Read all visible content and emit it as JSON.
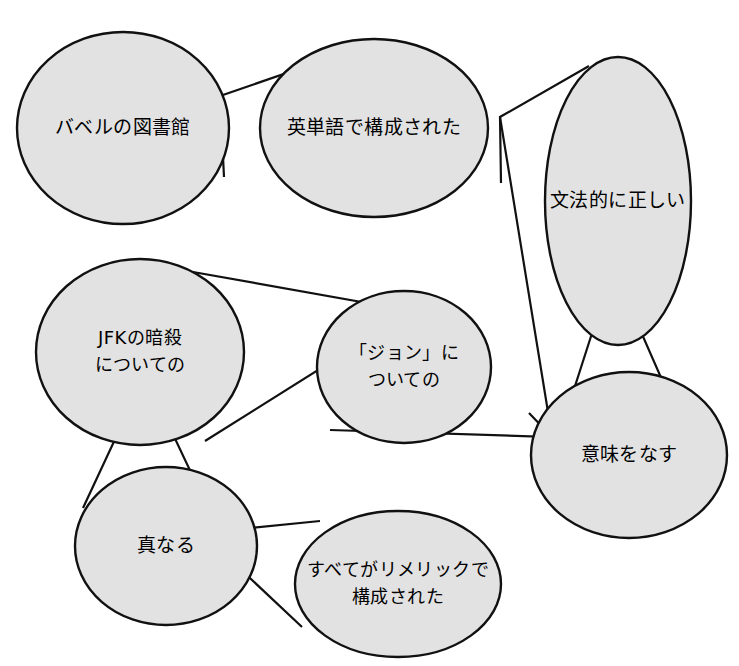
{
  "diagram": {
    "type": "concept-ellipse-graph",
    "title": "",
    "background_color": "#ffffff",
    "ellipse_fill": "#e2e2e2",
    "ellipse_stroke": "#111111",
    "line_stroke": "#111111",
    "nodes": [
      {
        "id": "library-of-babel",
        "label": "バベルの図書館",
        "lines": [
          "バベルの図書館"
        ],
        "cx": 123,
        "cy": 128,
        "rx": 106,
        "ry": 96
      },
      {
        "id": "composed-of-english-words",
        "label": "英単語で構成された",
        "lines": [
          "英単語で構成された"
        ],
        "cx": 374,
        "cy": 128,
        "rx": 114,
        "ry": 89
      },
      {
        "id": "grammatically-correct",
        "label": "文法的に正しい",
        "lines": [
          "文法的に正しい"
        ],
        "cx": 618,
        "cy": 201,
        "rx": 73,
        "ry": 144
      },
      {
        "id": "about-jfk-assassination",
        "label": "JFKの暗殺についての",
        "lines": [
          "JFKの暗殺",
          "についての"
        ],
        "cx": 140,
        "cy": 352,
        "rx": 104,
        "ry": 93
      },
      {
        "id": "about-john",
        "label": "「ジョン」についての",
        "lines": [
          "「ジョン」に",
          "ついての"
        ],
        "cx": 404,
        "cy": 367,
        "rx": 87,
        "ry": 76
      },
      {
        "id": "makes-sense",
        "label": "意味をなす",
        "lines": [
          "意味をなす"
        ],
        "cx": 629,
        "cy": 455,
        "rx": 98,
        "ry": 83
      },
      {
        "id": "true",
        "label": "真なる",
        "lines": [
          "真なる"
        ],
        "cx": 166,
        "cy": 546,
        "rx": 91,
        "ry": 79
      },
      {
        "id": "all-composed-of-limericks",
        "label": "すべてがリメリックで構成された",
        "lines": [
          "すべてがリメリックで",
          "構成された"
        ],
        "cx": 398,
        "cy": 584,
        "rx": 103,
        "ry": 73
      }
    ],
    "connectors": [
      {
        "id": "connector-babel-english",
        "from": "library-of-babel",
        "to": "composed-of-english-words",
        "points": "224,177 220,96 330,58"
      },
      {
        "id": "connector-english-grammar",
        "from": "composed-of-english-words",
        "to": "grammatically-correct",
        "points": "501,183 500,117 589,66"
      },
      {
        "id": "connector-grammar-down",
        "from": "grammatically-correct",
        "to": "makes-sense",
        "points": "500,117 548,412 565,432"
      },
      {
        "id": "connector-grammar-fork",
        "from": "grammatically-correct",
        "to": "makes-sense",
        "points": "557,442 613,268 691,446"
      },
      {
        "id": "connector-jfk-john",
        "from": "about-jfk-assassination",
        "to": "about-john",
        "points": "193,272 412,311 205,441"
      },
      {
        "id": "connector-john-sense",
        "from": "about-john",
        "to": "makes-sense",
        "points": "330,430 552,437 529,413"
      },
      {
        "id": "connector-jfk-true",
        "from": "about-jfk-assassination",
        "to": "true",
        "points": "83,508 145,375 212,517"
      },
      {
        "id": "connector-true-limerick",
        "from": "true",
        "to": "all-composed-of-limericks",
        "points": "320,521 202,533 302,627"
      }
    ]
  }
}
